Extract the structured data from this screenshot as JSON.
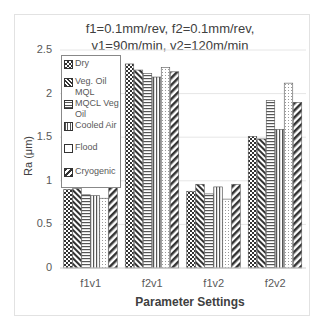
{
  "chart_data": {
    "type": "bar",
    "title": "f1=0.1mm/rev, f2=0.1mm/rev, v1=90m/min, v2=120m/min",
    "title_lines": [
      "f1=0.1mm/rev, f2=0.1mm/rev,",
      "v1=90m/min, v2=120m/min"
    ],
    "xlabel": "Parameter Settings",
    "ylabel": "Ra (μm)",
    "ylim": [
      0,
      2.5
    ],
    "yticks": [
      "0",
      "0.5",
      "1",
      "1.5",
      "2",
      "2.5"
    ],
    "categories": [
      "f1v1",
      "f2v1",
      "f1v2",
      "f2v2"
    ],
    "grid": true,
    "legend_position": "upper-left (inside)",
    "series": [
      {
        "name": "Dry",
        "pattern": "checker",
        "values": [
          0.9,
          2.34,
          0.88,
          1.51
        ]
      },
      {
        "name": "Veg. Oil MQL",
        "pattern": "diagonal",
        "values": [
          0.91,
          2.27,
          0.96,
          1.48
        ]
      },
      {
        "name": "MQCL Veg Oil",
        "pattern": "horizontal",
        "values": [
          0.84,
          2.23,
          0.85,
          1.92
        ]
      },
      {
        "name": "Cooled Air",
        "pattern": "vertical",
        "values": [
          0.83,
          2.19,
          0.93,
          1.59
        ]
      },
      {
        "name": "Flood",
        "pattern": "dots",
        "values": [
          0.8,
          2.3,
          0.79,
          2.12
        ]
      },
      {
        "name": "Cryogenic",
        "pattern": "wide-diagonal",
        "values": [
          0.93,
          2.25,
          0.96,
          1.9
        ]
      }
    ]
  },
  "legend": {
    "items": [
      "Dry",
      "Veg. Oil MQL",
      "MQCL Veg Oil",
      "Cooled Air",
      "Flood",
      "Cryogenic"
    ]
  }
}
